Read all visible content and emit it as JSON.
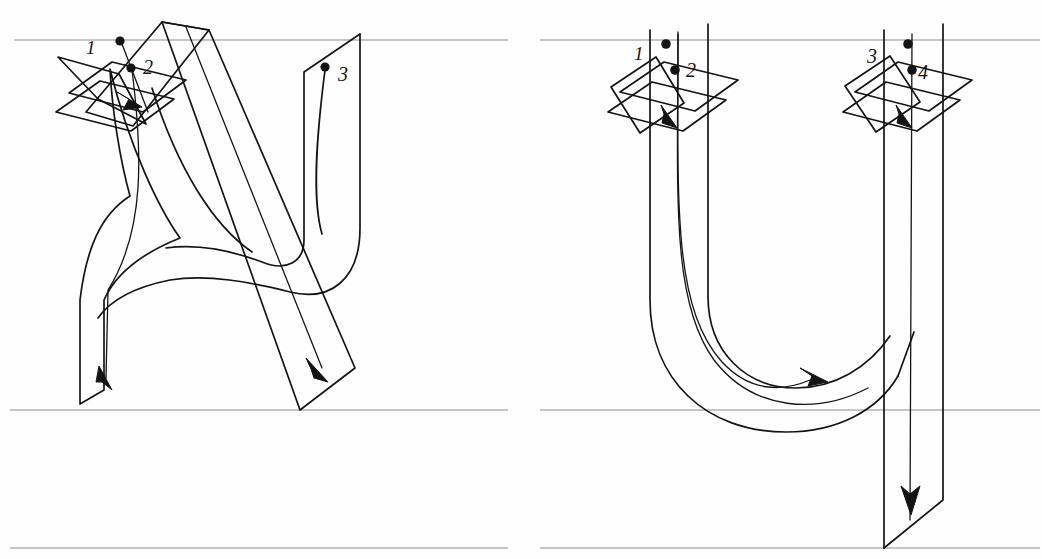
{
  "figure": {
    "kind": "handwriting-stroke-order-diagram",
    "background_color": "#fefefe",
    "ink_color": "#141414",
    "guide_line_color": "#8c8c8c",
    "panel_count": 2,
    "width": 1042,
    "height": 559
  },
  "guide_lines": {
    "names": [
      "top-line",
      "midline",
      "baseline"
    ],
    "y_values": [
      40,
      410,
      548
    ],
    "color": "#8c8c8c"
  },
  "panels": [
    {
      "id": "panel-left",
      "letter": "X",
      "x": 0,
      "width": 511,
      "stroke_count": 3,
      "strokes": [
        {
          "number": "1",
          "label_x": 88,
          "label_y": 36,
          "start_dot": {
            "x": 120,
            "y": 41
          },
          "direction": "down-left-diagonal",
          "arrow": "down-left"
        },
        {
          "number": "2",
          "label_x": 146,
          "label_y": 58,
          "start_dot": {
            "x": 131,
            "y": 68
          },
          "direction": "down-left-then-curve-down",
          "arrow": "down"
        },
        {
          "number": "3",
          "label_x": 340,
          "label_y": 66,
          "start_dot": {
            "x": 325,
            "y": 67
          },
          "direction": "down-right-diagonal",
          "arrow": "down-right"
        }
      ]
    },
    {
      "id": "panel-right",
      "letter": "U",
      "x": 538,
      "width": 504,
      "stroke_count": 2,
      "strokes": [
        {
          "number": "1",
          "label_x": 636,
          "label_y": 47,
          "start_dot": {
            "x": 666,
            "y": 44
          },
          "direction": "down-left-diagonal",
          "arrow": "down-left"
        },
        {
          "number": "2",
          "label_x": 687,
          "label_y": 63,
          "start_dot": {
            "x": 675,
            "y": 70
          },
          "direction": "down-then-curve-right",
          "arrow": "right"
        },
        {
          "number": "3",
          "label_x": 868,
          "label_y": 50,
          "start_dot": {
            "x": 908,
            "y": 44
          },
          "direction": "down-left-diagonal",
          "arrow": "down-left"
        },
        {
          "number": "4",
          "label_x": 919,
          "label_y": 65,
          "start_dot": {
            "x": 912,
            "y": 70
          },
          "direction": "straight-down-below-baseline",
          "arrow": "down"
        }
      ]
    }
  ]
}
